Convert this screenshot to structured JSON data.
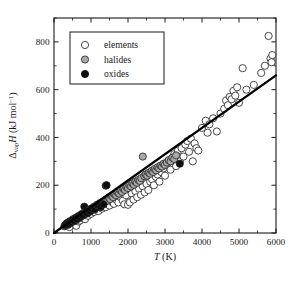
{
  "figure": {
    "caption_title": "",
    "background": "#ffffff"
  },
  "chart_data": {
    "type": "scatter",
    "title": "",
    "xlabel": "T (K)",
    "ylabel": "ΔvapH (kJ mol-1)",
    "ylabel_parts": {
      "delta": "Δ",
      "subscript": "vap",
      "quantity": "H",
      "units_open": " (kJ mol",
      "units_exp": "−1",
      "units_close": ")"
    },
    "xlabel_parts": {
      "symbol": "T",
      "units": " (K)"
    },
    "xlim": [
      0,
      6000
    ],
    "ylim": [
      0,
      900
    ],
    "xticks": [
      0,
      1000,
      2000,
      3000,
      4000,
      5000,
      6000
    ],
    "xticklabels": [
      "0",
      "1000",
      "2000",
      "3000",
      "4000",
      "5000",
      "6000"
    ],
    "yticks": [
      0,
      200,
      400,
      600,
      800
    ],
    "yticklabels": [
      "0",
      "200",
      "400",
      "600",
      "800"
    ],
    "x_minor_step": 500,
    "y_minor_step": 100,
    "grid": false,
    "ticks_all_sides": true,
    "legend_position": "upper-left",
    "legend": [
      {
        "label": "elements",
        "marker": "open-circle",
        "color": "#ffffff",
        "edge": "#2b2b2b"
      },
      {
        "label": "halides",
        "marker": "gray-circle",
        "color": "#a8a8a8",
        "edge": "#2b2b2b"
      },
      {
        "label": "oxides",
        "marker": "filled-circle",
        "color": "#0d0d0d",
        "edge": "#0d0d0d"
      }
    ],
    "trendline": {
      "label": "linear fit",
      "x": [
        0,
        6000
      ],
      "y": [
        0,
        660
      ],
      "slope": 0.11,
      "intercept": 0
    },
    "series": [
      {
        "name": "elements",
        "marker": "open-circle",
        "points": [
          [
            330,
            30
          ],
          [
            380,
            38
          ],
          [
            420,
            25
          ],
          [
            460,
            45
          ],
          [
            520,
            40
          ],
          [
            560,
            55
          ],
          [
            600,
            30
          ],
          [
            630,
            60
          ],
          [
            660,
            48
          ],
          [
            700,
            52
          ],
          [
            720,
            70
          ],
          [
            760,
            62
          ],
          [
            800,
            75
          ],
          [
            840,
            58
          ],
          [
            880,
            85
          ],
          [
            920,
            72
          ],
          [
            960,
            90
          ],
          [
            1000,
            80
          ],
          [
            1040,
            95
          ],
          [
            1080,
            88
          ],
          [
            1150,
            100
          ],
          [
            1200,
            92
          ],
          [
            1250,
            110
          ],
          [
            1300,
            102
          ],
          [
            1350,
            118
          ],
          [
            1400,
            108
          ],
          [
            1450,
            125
          ],
          [
            1500,
            115
          ],
          [
            1560,
            130
          ],
          [
            1620,
            122
          ],
          [
            1680,
            140
          ],
          [
            1740,
            128
          ],
          [
            1800,
            150
          ],
          [
            1860,
            135
          ],
          [
            1900,
            120
          ],
          [
            1950,
            158
          ],
          [
            2000,
            118
          ],
          [
            2050,
            128
          ],
          [
            2100,
            165
          ],
          [
            2150,
            140
          ],
          [
            2200,
            175
          ],
          [
            2250,
            150
          ],
          [
            2300,
            185
          ],
          [
            2350,
            160
          ],
          [
            2400,
            195
          ],
          [
            2450,
            170
          ],
          [
            2500,
            205
          ],
          [
            2550,
            180
          ],
          [
            2600,
            215
          ],
          [
            2650,
            225
          ],
          [
            2700,
            200
          ],
          [
            2750,
            235
          ],
          [
            2800,
            245
          ],
          [
            2850,
            215
          ],
          [
            2900,
            255
          ],
          [
            2950,
            270
          ],
          [
            3000,
            240
          ],
          [
            3050,
            285
          ],
          [
            3100,
            300
          ],
          [
            3150,
            265
          ],
          [
            3200,
            310
          ],
          [
            3250,
            330
          ],
          [
            3300,
            280
          ],
          [
            3350,
            345
          ],
          [
            3400,
            300
          ],
          [
            3450,
            355
          ],
          [
            3500,
            320
          ],
          [
            3550,
            370
          ],
          [
            3600,
            385
          ],
          [
            3650,
            340
          ],
          [
            3700,
            395
          ],
          [
            3750,
            300
          ],
          [
            3800,
            375
          ],
          [
            3850,
            355
          ],
          [
            3900,
            345
          ],
          [
            4000,
            440
          ],
          [
            4100,
            470
          ],
          [
            4150,
            420
          ],
          [
            4200,
            455
          ],
          [
            4300,
            480
          ],
          [
            4400,
            425
          ],
          [
            4500,
            500
          ],
          [
            4600,
            520
          ],
          [
            4650,
            555
          ],
          [
            4700,
            535
          ],
          [
            4750,
            570
          ],
          [
            4800,
            560
          ],
          [
            4850,
            595
          ],
          [
            4900,
            575
          ],
          [
            4950,
            610
          ],
          [
            5000,
            545
          ],
          [
            5100,
            690
          ],
          [
            5200,
            600
          ],
          [
            5400,
            620
          ],
          [
            5600,
            670
          ],
          [
            5700,
            700
          ],
          [
            5800,
            825
          ],
          [
            5850,
            730
          ],
          [
            5880,
            715
          ],
          [
            5900,
            745
          ]
        ]
      },
      {
        "name": "halides",
        "marker": "gray-circle",
        "points": [
          [
            280,
            28
          ],
          [
            320,
            35
          ],
          [
            360,
            42
          ],
          [
            400,
            38
          ],
          [
            440,
            50
          ],
          [
            480,
            45
          ],
          [
            520,
            58
          ],
          [
            560,
            52
          ],
          [
            600,
            65
          ],
          [
            640,
            60
          ],
          [
            680,
            72
          ],
          [
            720,
            68
          ],
          [
            760,
            80
          ],
          [
            800,
            75
          ],
          [
            840,
            88
          ],
          [
            880,
            82
          ],
          [
            920,
            95
          ],
          [
            960,
            90
          ],
          [
            1000,
            102
          ],
          [
            1040,
            98
          ],
          [
            1080,
            110
          ],
          [
            1120,
            105
          ],
          [
            1160,
            118
          ],
          [
            1200,
            112
          ],
          [
            1240,
            125
          ],
          [
            1280,
            120
          ],
          [
            1320,
            132
          ],
          [
            1360,
            128
          ],
          [
            1400,
            140
          ],
          [
            1440,
            135
          ],
          [
            1480,
            148
          ],
          [
            1520,
            142
          ],
          [
            1560,
            155
          ],
          [
            1600,
            150
          ],
          [
            1640,
            162
          ],
          [
            1680,
            158
          ],
          [
            1720,
            170
          ],
          [
            1760,
            165
          ],
          [
            1800,
            178
          ],
          [
            1840,
            172
          ],
          [
            1880,
            185
          ],
          [
            1920,
            180
          ],
          [
            1960,
            192
          ],
          [
            2000,
            188
          ],
          [
            2040,
            200
          ],
          [
            2080,
            195
          ],
          [
            2120,
            208
          ],
          [
            2160,
            202
          ],
          [
            2200,
            215
          ],
          [
            2240,
            210
          ],
          [
            2280,
            222
          ],
          [
            2320,
            218
          ],
          [
            2360,
            230
          ],
          [
            2400,
            320
          ],
          [
            2440,
            238
          ],
          [
            2480,
            245
          ],
          [
            2520,
            240
          ],
          [
            2560,
            252
          ],
          [
            2600,
            248
          ],
          [
            2640,
            260
          ],
          [
            2680,
            255
          ],
          [
            2720,
            268
          ],
          [
            2760,
            262
          ],
          [
            2800,
            275
          ],
          [
            2840,
            270
          ],
          [
            2880,
            282
          ],
          [
            2920,
            278
          ],
          [
            2960,
            290
          ],
          [
            3000,
            285
          ],
          [
            3050,
            295
          ],
          [
            3100,
            305
          ],
          [
            3150,
            300
          ],
          [
            3200,
            315
          ],
          [
            3250,
            310
          ],
          [
            3300,
            325
          ]
        ]
      },
      {
        "name": "oxides",
        "marker": "filled-circle",
        "points": [
          [
            300,
            32
          ],
          [
            340,
            40
          ],
          [
            380,
            35
          ],
          [
            420,
            48
          ],
          [
            460,
            44
          ],
          [
            500,
            55
          ],
          [
            540,
            50
          ],
          [
            580,
            62
          ],
          [
            620,
            58
          ],
          [
            660,
            70
          ],
          [
            700,
            66
          ],
          [
            740,
            78
          ],
          [
            780,
            74
          ],
          [
            820,
            110
          ],
          [
            860,
            86
          ],
          [
            900,
            82
          ],
          [
            940,
            94
          ],
          [
            980,
            90
          ],
          [
            1020,
            102
          ],
          [
            1100,
            98
          ],
          [
            1180,
            115
          ],
          [
            1260,
            108
          ],
          [
            1340,
            120
          ],
          [
            1400,
            198
          ],
          [
            1420,
            200
          ],
          [
            3400,
            290
          ]
        ]
      }
    ]
  }
}
